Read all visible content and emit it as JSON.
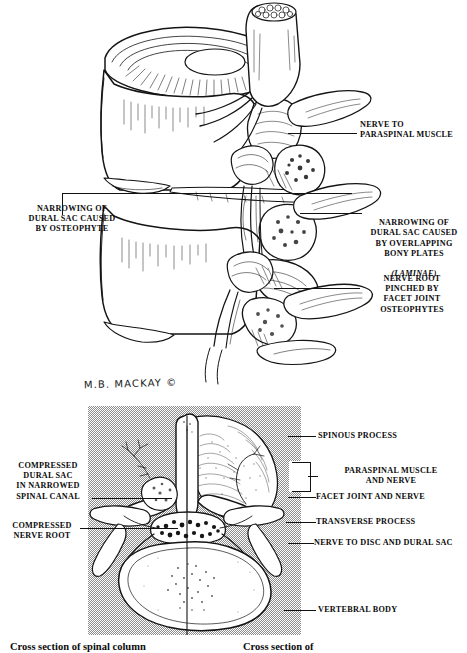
{
  "figure": {
    "artist_signature": "M.B. MACKAY ©"
  },
  "top_illustration": {
    "name": "sagittal-view-lumbar-spine",
    "labels": [
      {
        "id": "narrowing-osteophyte",
        "text": "NARROWING OF\nDURAL SAC CAUSED\nBY OSTEOPHYTE",
        "align": "center",
        "side": "left"
      },
      {
        "id": "nerve-to-paraspinal-muscle",
        "text": "NERVE TO\nPARASPINAL MUSCLE",
        "align": "left",
        "side": "right"
      },
      {
        "id": "narrowing-bony-plates",
        "text": "NARROWING OF\nDURAL SAC CAUSED\nBY OVERLAPPING\nBONY PLATES",
        "italic_suffix": "(LAMINAE)",
        "align": "center",
        "side": "right"
      },
      {
        "id": "nerve-root-pinched",
        "text": "NERVE ROOT\nPINCHED BY\nFACET JOINT\nOSTEOPHYTES",
        "align": "center",
        "side": "right"
      }
    ]
  },
  "bottom_illustration": {
    "name": "axial-cross-section-spinal-column",
    "labels_left": [
      {
        "id": "compressed-dural-sac",
        "text": "COMPRESSED\nDURAL SAC\nIN NARROWED\nSPINAL CANAL"
      },
      {
        "id": "compressed-nerve-root",
        "text": "COMPRESSED\nNERVE ROOT"
      }
    ],
    "labels_right": [
      {
        "id": "spinous-process",
        "text": "SPINOUS PROCESS"
      },
      {
        "id": "paraspinal-muscle-and-nerve",
        "text": "PARASPINAL MUSCLE\nAND NERVE"
      },
      {
        "id": "facet-joint-and-nerve",
        "text": "FACET JOINT AND NERVE"
      },
      {
        "id": "transverse-process",
        "text": "TRANSVERSE  PROCESS"
      },
      {
        "id": "nerve-to-disc-and-dural-sac",
        "text": "NERVE TO DISC AND DURAL SAC"
      },
      {
        "id": "vertebral-body",
        "text": "VERTEBRAL BODY"
      }
    ]
  },
  "captions": [
    {
      "id": "caption-left",
      "text": "Cross section of spinal column"
    },
    {
      "id": "caption-right",
      "text": "Cross section of"
    }
  ],
  "colors": {
    "ink": "#141414",
    "panel_gray": "#8d8d8d",
    "paper": "#ffffff"
  }
}
